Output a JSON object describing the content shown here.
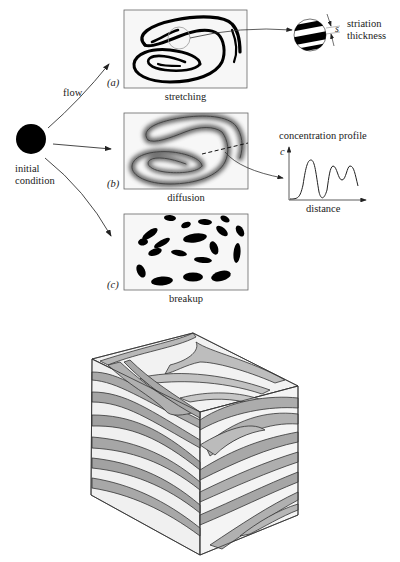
{
  "initial": {
    "label_line1": "initial",
    "label_line2": "condition"
  },
  "arrows": {
    "flow_label": "flow"
  },
  "panels": [
    {
      "id": "a",
      "tag": "(a)",
      "caption": "stretching"
    },
    {
      "id": "b",
      "tag": "(b)",
      "caption": "diffusion"
    },
    {
      "id": "c",
      "tag": "(c)",
      "caption": "breakup"
    }
  ],
  "inset_striation": {
    "symbol": "s",
    "label_line1": "striation",
    "label_line2": "thickness"
  },
  "inset_profile": {
    "title": "concentration profile",
    "y_axis": "c",
    "x_axis": "distance"
  },
  "colors": {
    "ink": "#111111",
    "stripe_dark": "#9a9a9a",
    "stripe_light": "#ececec",
    "box_border": "#555555"
  }
}
